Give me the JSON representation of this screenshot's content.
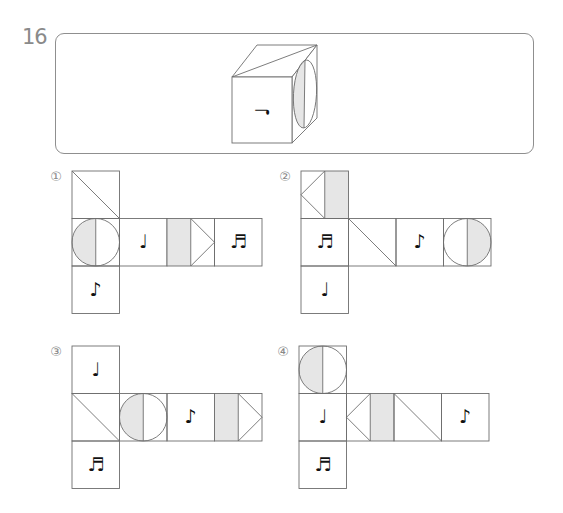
{
  "question": {
    "number": "16",
    "shade_color": "#e6e6e6",
    "line_color": "#6e6e6e",
    "cube": {
      "front_face": {
        "symbol": "quarter-note",
        "glyph": "♩",
        "rotation_deg": -90
      },
      "top_face": {
        "pattern": "diagonal"
      },
      "right_face": {
        "pattern": "circle-left-half-shaded"
      }
    }
  },
  "options": [
    {
      "label": "①",
      "number": 1,
      "origin": [
        72,
        171
      ],
      "cells": [
        {
          "col": 0,
          "row": 0,
          "face": "diagonal-tl-br"
        },
        {
          "col": 0,
          "row": 1,
          "face": "circle-left-shaded"
        },
        {
          "col": 1,
          "row": 1,
          "face": "note",
          "glyph": "♩"
        },
        {
          "col": 2,
          "row": 1,
          "face": "shaded-left-triangle-right"
        },
        {
          "col": 3,
          "row": 1,
          "face": "note",
          "glyph": "♬"
        },
        {
          "col": 0,
          "row": 2,
          "face": "note",
          "glyph": "♪"
        }
      ]
    },
    {
      "label": "②",
      "number": 2,
      "origin": [
        301,
        171
      ],
      "cells": [
        {
          "col": 0,
          "row": 0,
          "face": "triangle-left-shaded-right"
        },
        {
          "col": 0,
          "row": 1,
          "face": "note",
          "glyph": "♬"
        },
        {
          "col": 1,
          "row": 1,
          "face": "diagonal-tl-br"
        },
        {
          "col": 2,
          "row": 1,
          "face": "note",
          "glyph": "♪"
        },
        {
          "col": 3,
          "row": 1,
          "face": "circle-right-shaded"
        },
        {
          "col": 0,
          "row": 2,
          "face": "note",
          "glyph": "♩"
        }
      ]
    },
    {
      "label": "③",
      "number": 3,
      "origin": [
        72,
        346
      ],
      "cells": [
        {
          "col": 0,
          "row": 0,
          "face": "note",
          "glyph": "♩"
        },
        {
          "col": 0,
          "row": 1,
          "face": "diagonal-tl-br"
        },
        {
          "col": 1,
          "row": 1,
          "face": "circle-left-shaded"
        },
        {
          "col": 2,
          "row": 1,
          "face": "note",
          "glyph": "♪"
        },
        {
          "col": 3,
          "row": 1,
          "face": "shaded-left-triangle-right"
        },
        {
          "col": 0,
          "row": 2,
          "face": "note",
          "glyph": "♬"
        }
      ]
    },
    {
      "label": "④",
      "number": 4,
      "origin": [
        299,
        346
      ],
      "cells": [
        {
          "col": 0,
          "row": 0,
          "face": "circle-left-shaded"
        },
        {
          "col": 0,
          "row": 1,
          "face": "note",
          "glyph": "♩"
        },
        {
          "col": 1,
          "row": 1,
          "face": "triangle-left-shaded-right"
        },
        {
          "col": 2,
          "row": 1,
          "face": "diagonal-tl-br"
        },
        {
          "col": 3,
          "row": 1,
          "face": "note",
          "glyph": "♪"
        },
        {
          "col": 0,
          "row": 2,
          "face": "note",
          "glyph": "♬"
        }
      ]
    }
  ]
}
